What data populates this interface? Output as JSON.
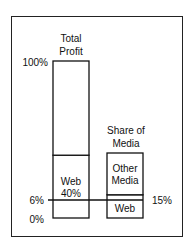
{
  "chart_data": {
    "type": "bar",
    "title": "",
    "bars": [
      {
        "name": "Total Profit",
        "title_lines": [
          "Total",
          "Profit"
        ],
        "total": 100,
        "segments": [
          {
            "label_lines": [
              "Web",
              "40%"
            ],
            "value": 40
          },
          {
            "label_lines": [],
            "value": 60
          }
        ]
      },
      {
        "name": "Share of Media",
        "title_lines": [
          "Share of",
          "Media"
        ],
        "total": 42,
        "segments": [
          {
            "label_lines": [
              "Web"
            ],
            "value": 15
          },
          {
            "label_lines": [
              "Other",
              "Media"
            ],
            "value": 27
          }
        ]
      }
    ],
    "reference_line": {
      "left_label": "6%",
      "right_label": "15%"
    },
    "y_tick_labels": {
      "top": "100%",
      "bottom": "0%"
    },
    "xlabel": "",
    "ylabel": "",
    "ylim": [
      0,
      100
    ]
  }
}
